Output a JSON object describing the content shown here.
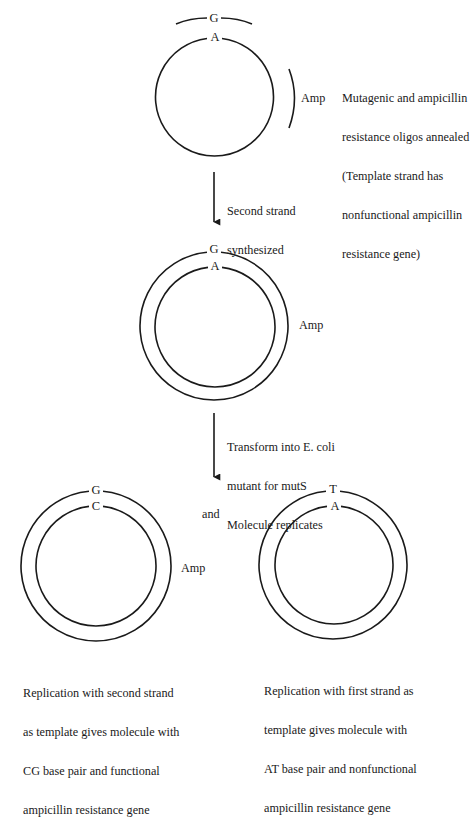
{
  "colors": {
    "stroke": "#1a1a1a",
    "background": "#ffffff"
  },
  "step1": {
    "top_base_oligo": "G",
    "top_base_template": "A",
    "amp_label": "Amp",
    "description": [
      "Mutagenic and ampicillin",
      "resistance oligos annealed",
      "(Template strand has",
      "nonfunctional ampicillin",
      "resistance gene)"
    ]
  },
  "arrow1": {
    "label": [
      "Second strand",
      "synthesized"
    ]
  },
  "step2": {
    "top_base_outer": "G",
    "top_base_inner": "A",
    "amp_label": "Amp"
  },
  "arrow2": {
    "label": [
      "Transform into E. coli",
      "mutant for mutS",
      "Molecule replicates"
    ]
  },
  "conjunction": "and",
  "result_left": {
    "top_base_outer": "G",
    "top_base_inner": "C",
    "amp_label": "Amp",
    "caption": [
      "Replication with second strand",
      "as template gives molecule with",
      "CG base pair and functional",
      "ampicillin resistance gene"
    ]
  },
  "result_right": {
    "top_base_outer": "T",
    "top_base_inner": "A",
    "caption": [
      "Replication with first strand as",
      "template gives molecule with",
      "AT base pair and nonfunctional",
      "ampicillin resistance gene"
    ]
  }
}
